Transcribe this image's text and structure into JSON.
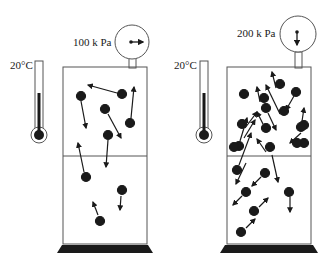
{
  "diagram": {
    "left": {
      "pressure_label": "100 k Pa",
      "temperature_label": "20°C",
      "particle_count": 12
    },
    "right": {
      "pressure_label": "200 k Pa",
      "temperature_label": "20°C",
      "particle_count": 26
    },
    "colors": {
      "ink": "#1a1a1a",
      "outline": "#555555",
      "background": "#ffffff"
    }
  }
}
